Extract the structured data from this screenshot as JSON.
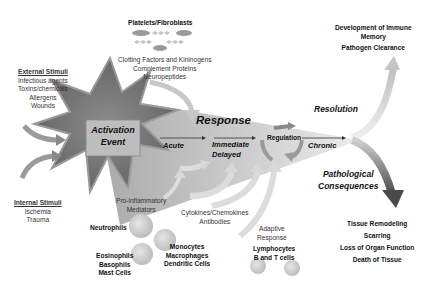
{
  "diagram": {
    "center": {
      "activation_event": [
        "Activation",
        "Event"
      ],
      "response": "Response",
      "acute": "Acute",
      "immediate_delayed": [
        "Immediate",
        "Delayed"
      ],
      "regulation": "Regulation",
      "chronic": "Chronic"
    },
    "external_stimuli": {
      "title": "External Stimuli",
      "items": [
        "Infectious agents",
        "Toxins/chemicals",
        "Allergens",
        "Wounds"
      ]
    },
    "internal_stimuli": {
      "title": "Internal Stimuli",
      "items": [
        "Ischemia",
        "Trauma"
      ]
    },
    "platelets": {
      "title": "Platelets/Fibroblasts",
      "factors": [
        "Clotting Factors and Kininogens",
        "Complement Proteins",
        "Neuropeptides"
      ]
    },
    "pro_inflammatory": [
      "Pro-inflammatory",
      "Mediators"
    ],
    "cytokines": [
      "Cytokines/Chemokines",
      "Antibodies"
    ],
    "adaptive": [
      "Adaptive",
      "Response"
    ],
    "lymphocytes": [
      "Lymphocytes",
      "B and T cells"
    ],
    "cells": {
      "neutrophils": "Neutrophils",
      "eosinophils": [
        "Eosinophils",
        "Basophils",
        "Mast Cells"
      ],
      "monocytes": [
        "Monocytes",
        "Macrophages",
        "Dendritic Cells"
      ]
    },
    "resolution": {
      "label": "Resolution",
      "outcomes": [
        "Development of Immune",
        "Memory",
        "Pathogen Clearance"
      ]
    },
    "pathological": {
      "label": [
        "Pathological",
        "Consequences"
      ],
      "outcomes": [
        "Tissue Remodeling",
        "Scarring",
        "Loss of Organ Function",
        "Death of Tissue"
      ]
    },
    "colors": {
      "star_fill": "#7a7a7a",
      "cone_fill": "#cfcfcf",
      "activation_box": "#bdbdbd",
      "arrow_light": "#d6d6d6",
      "arrow_dark": "#5a5a5a"
    }
  }
}
